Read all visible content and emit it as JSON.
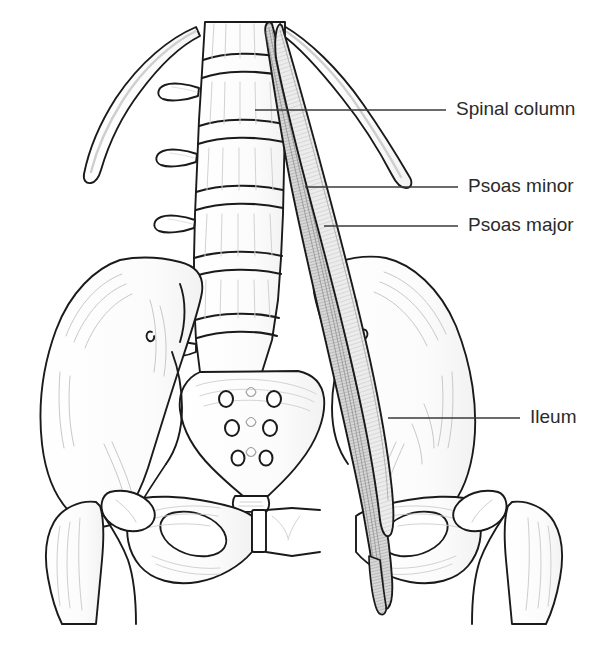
{
  "figure": {
    "background_color": "#ffffff",
    "line_color": "#1a1a1a",
    "text_color": "#2b2b2b",
    "muscle_fill_color": "#c9c9c9",
    "bone_fill_color": "#ffffff",
    "leader_line_color": "#3a3a3a",
    "width": 609,
    "height": 645
  },
  "labels": [
    {
      "id": "spinal-column",
      "text": "Spinal column",
      "text_x": 456,
      "text_y": 110,
      "leader": {
        "x1": 255,
        "y1": 110,
        "x2": 446,
        "y2": 110
      }
    },
    {
      "id": "psoas-minor",
      "text": "Psoas minor",
      "text_x": 468,
      "text_y": 187,
      "leader": {
        "x1": 305,
        "y1": 187,
        "x2": 458,
        "y2": 187
      }
    },
    {
      "id": "psoas-major",
      "text": "Psoas major",
      "text_x": 468,
      "text_y": 226,
      "leader": {
        "x1": 324,
        "y1": 226,
        "x2": 458,
        "y2": 226
      }
    },
    {
      "id": "ileum",
      "text": "Ileum",
      "text_x": 530,
      "text_y": 418,
      "leader": {
        "x1": 388,
        "y1": 418,
        "x2": 520,
        "y2": 418
      }
    }
  ],
  "structures": {
    "ribs": "twelfth rib pair",
    "vertebrae": "lumbar vertebrae L1-L5 with transverse processes",
    "sacrum": "sacrum with three pairs of sacral foramina",
    "coccyx": "coccyx",
    "ilium": "left and right iliac wings",
    "pubis": "pubic symphysis and obturator foramina",
    "femur": "left and right femoral heads, necks and greater trochanters",
    "muscle": "psoas major and psoas minor descending from lumbar spine to lesser trochanter"
  }
}
